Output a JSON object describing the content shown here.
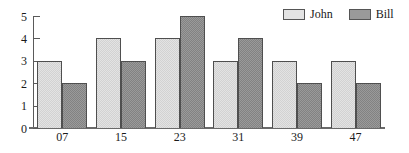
{
  "chart_data": {
    "type": "bar",
    "title": "",
    "xlabel": "",
    "ylabel": "",
    "categories": [
      "07",
      "15",
      "23",
      "31",
      "39",
      "47"
    ],
    "series": [
      {
        "name": "John",
        "color": "#e3e3e3",
        "values": [
          3,
          4,
          4,
          3,
          3,
          3
        ]
      },
      {
        "name": "Bill",
        "color": "#9a9a9a",
        "values": [
          2,
          3,
          5,
          4,
          2,
          2
        ]
      }
    ],
    "ylim": [
      0,
      5
    ],
    "yticks": [
      "0",
      "1",
      "2",
      "3",
      "4",
      "5"
    ],
    "ytick_values": [
      0,
      1,
      2,
      3,
      4,
      5
    ],
    "grid": false,
    "legend_position": "top-right"
  },
  "legend": {
    "entries": [
      {
        "label": "John"
      },
      {
        "label": "Bill"
      }
    ]
  },
  "colors": {
    "series_john": "#e3e3e3",
    "series_bill": "#9a9a9a",
    "axis": "#5a5a5a",
    "bar_outline": "#4f4f4f",
    "text": "#1a1a1a",
    "background": "#ffffff"
  }
}
